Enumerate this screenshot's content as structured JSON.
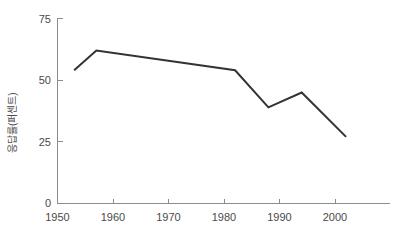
{
  "chart_data": {
    "type": "line",
    "title": "",
    "subtitle": "",
    "xlabel": "",
    "ylabel": "응답률(퍼센트)",
    "xlim": [
      1950,
      2005
    ],
    "ylim": [
      0,
      75
    ],
    "xticks": [
      1950,
      1960,
      1970,
      1980,
      1990,
      2000
    ],
    "xtick_labels": [
      "1950",
      "1960",
      "1970",
      "1980",
      "1990",
      "2000"
    ],
    "yticks": [
      0,
      25,
      50,
      75
    ],
    "ytick_labels": [
      "0",
      "25",
      "50",
      "75"
    ],
    "grid": false,
    "legend": false,
    "legend_position": "none",
    "series": [
      {
        "name": "응답률",
        "color": "#333333",
        "x": [
          1953,
          1957,
          1982,
          1988,
          1994,
          2002
        ],
        "values": [
          54,
          62,
          54,
          39,
          45,
          27
        ],
        "points": [
          {
            "x": 1953,
            "y": 54
          },
          {
            "x": 1957,
            "y": 62
          },
          {
            "x": 1982,
            "y": 54
          },
          {
            "x": 1988,
            "y": 39
          },
          {
            "x": 1994,
            "y": 45
          },
          {
            "x": 2002,
            "y": 27
          }
        ]
      }
    ],
    "annotations": [],
    "colors": {
      "line": "#333333",
      "axis": "#8c8c8c",
      "text": "#4a4a4a",
      "background": "#ffffff"
    }
  }
}
